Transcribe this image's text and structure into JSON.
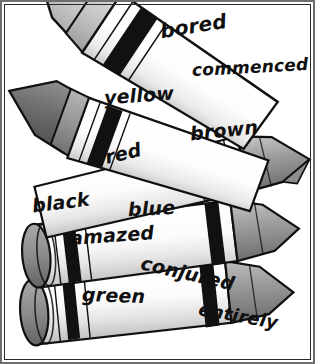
{
  "image": {
    "kind": "line-art-illustration",
    "subject": "crayons",
    "palette": {
      "outline": "#101010",
      "band": "#111111",
      "paper_light": "#fdfdfd",
      "paper_shade": "#d9d9d9",
      "tip_light": "#d0d0d0",
      "tip_mid": "#9a9a9a",
      "tip_dark": "#6f6f6f",
      "frame": "#2b2b2b",
      "background": "#ffffff"
    }
  },
  "labels": [
    {
      "id": "bored",
      "text": "bored",
      "x": 160,
      "y": 14,
      "size": 20,
      "rotate": -9,
      "group": "extra"
    },
    {
      "id": "commenced",
      "text": "commenced",
      "x": 192,
      "y": 58,
      "size": 17,
      "rotate": -3,
      "group": "extra"
    },
    {
      "id": "yellow",
      "text": "yellow",
      "x": 104,
      "y": 85,
      "size": 19,
      "rotate": -4,
      "group": "color"
    },
    {
      "id": "brown",
      "text": "brown",
      "x": 190,
      "y": 120,
      "size": 19,
      "rotate": -6,
      "group": "color"
    },
    {
      "id": "red",
      "text": "red",
      "x": 105,
      "y": 143,
      "size": 19,
      "rotate": -13,
      "group": "color"
    },
    {
      "id": "black",
      "text": "black",
      "x": 32,
      "y": 192,
      "size": 19,
      "rotate": -7,
      "group": "color"
    },
    {
      "id": "blue",
      "text": "blue",
      "x": 128,
      "y": 198,
      "size": 19,
      "rotate": -3,
      "group": "color"
    },
    {
      "id": "amazed",
      "text": "amazed",
      "x": 70,
      "y": 225,
      "size": 19,
      "rotate": -4,
      "group": "extra"
    },
    {
      "id": "conjured",
      "text": "conjured",
      "x": 140,
      "y": 263,
      "size": 19,
      "rotate": 13,
      "group": "extra"
    },
    {
      "id": "green",
      "text": "green",
      "x": 82,
      "y": 285,
      "size": 19,
      "rotate": 2,
      "group": "color"
    },
    {
      "id": "entirely",
      "text": "entirely",
      "x": 198,
      "y": 306,
      "size": 18,
      "rotate": 10,
      "group": "extra"
    }
  ],
  "crayons": [
    {
      "id": "crayon-yellow",
      "label": "yellow",
      "tip_shade": "light",
      "left": 8,
      "top": 18,
      "rotate": 33,
      "length": 235,
      "width": 64
    },
    {
      "id": "crayon-red",
      "label": "red",
      "tip_shade": "dark",
      "left": 2,
      "top": 112,
      "rotate": 20,
      "length": 245,
      "width": 58
    },
    {
      "id": "crayon-brown",
      "label": "brown",
      "tip_shade": "mid",
      "left": 50,
      "top": 150,
      "rotate": -10,
      "length": 262,
      "width": 56
    },
    {
      "id": "crayon-blue",
      "label": "blue",
      "tip_shade": "mid",
      "left": 14,
      "top": 208,
      "rotate": -6,
      "length": 282,
      "width": 54
    },
    {
      "id": "crayon-green",
      "label": "green",
      "tip_shade": "mid",
      "left": 14,
      "top": 268,
      "rotate": -5,
      "length": 282,
      "width": 54
    }
  ]
}
